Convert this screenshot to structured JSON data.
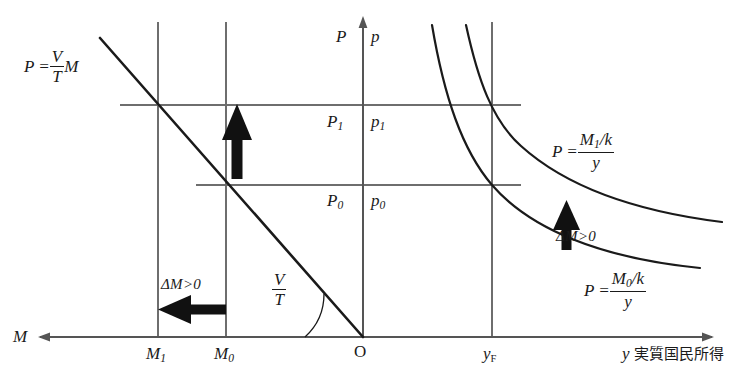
{
  "diagram": {
    "colors": {
      "ink": "#1a1a1a",
      "grid": "#6e6e6e",
      "bold": "#111111"
    }
  },
  "axes": {
    "left_axis_label": "M",
    "vertical_axis_left_label": "P",
    "vertical_axis_right_label": "p",
    "origin_label": "O",
    "right_axis_symbol": "y",
    "right_axis_text": "実質国民所得",
    "ticks": {
      "m1": "M",
      "m1_sub": "1",
      "m0": "M",
      "m0_sub": "0",
      "yf": "y",
      "yf_sub": "F",
      "p1": "P",
      "p1_sub": "1",
      "p1_right": "p",
      "p1_right_sub": "1",
      "p0": "P",
      "p0_sub": "0",
      "p0_right": "p",
      "p0_right_sub": "0"
    }
  },
  "equations": {
    "left_line": {
      "lhs": "P =",
      "num": "V",
      "den": "T",
      "tail": "M"
    },
    "slope_angle": {
      "num": "V",
      "den": "T"
    },
    "upper_hyperbola": {
      "lhs": "P =",
      "num": "M",
      "num_sub": "1",
      "num_tail": "/k",
      "den": "y"
    },
    "lower_hyperbola": {
      "lhs": "P =",
      "num": "M",
      "num_sub": "0",
      "num_tail": "/k",
      "den": "y"
    }
  },
  "annotations": {
    "delta_left": "ΔM>0",
    "delta_up": "ΔM>0",
    "delta_right": "ΔM>0"
  }
}
